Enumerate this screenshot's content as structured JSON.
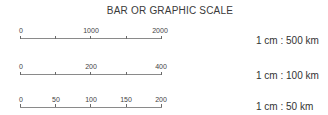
{
  "title": "BAR OR GRAPHIC SCALE",
  "scales": [
    {
      "ratio": "1 cm : 500 km",
      "ticks": [
        "0",
        "",
        "1000",
        "",
        "2000"
      ]
    },
    {
      "ratio": "1 cm : 100 km",
      "ticks": [
        "0",
        "",
        "200",
        "",
        "400"
      ]
    },
    {
      "ratio": "1 cm : 50 km",
      "ticks": [
        "0",
        "50",
        "100",
        "150",
        "200"
      ]
    }
  ]
}
